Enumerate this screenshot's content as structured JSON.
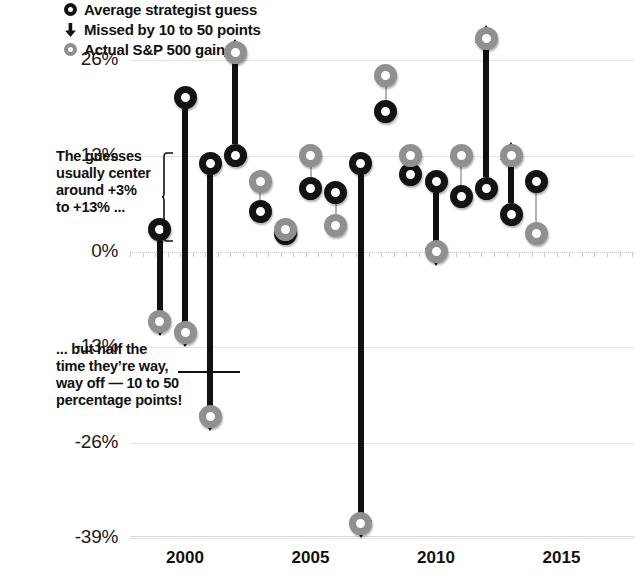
{
  "chart_data": {
    "type": "scatter",
    "title": "",
    "subtitle": "",
    "xlabel": "",
    "ylabel": "",
    "xtick_labels": [
      "2000",
      "2005",
      "2010",
      "2015"
    ],
    "xtick_values": [
      2000,
      2005,
      2010,
      2015
    ],
    "ytick_labels": [
      "26%",
      "13%",
      "0%",
      "-13%",
      "-26%",
      "-39%"
    ],
    "ytick_values": [
      26,
      13,
      0,
      -13,
      -26,
      -39
    ],
    "ylim": [
      -42,
      31
    ],
    "xlim": [
      1998.2,
      2016.6
    ],
    "grid": true,
    "legend_position": "top-left",
    "legend": [
      {
        "key": "guess",
        "label": "Average strategist guess",
        "marker": "ring-black",
        "color": "#131313"
      },
      {
        "key": "missed",
        "label": "Missed by 10 to 50 points",
        "marker": "down-arrow",
        "color": "#101010"
      },
      {
        "key": "actual",
        "label": "Actual S&P 500 gain",
        "marker": "ring-gray",
        "color": "#909090"
      }
    ],
    "series": [
      {
        "name": "Average strategist guess",
        "color": "#131313",
        "values": [
          3.0,
          21.0,
          12.0,
          13.0,
          5.5,
          2.5,
          8.5,
          8.0,
          12.0,
          19.0,
          10.5,
          9.5,
          7.5,
          8.5,
          5.0,
          9.5
        ]
      },
      {
        "name": "Actual S&P 500 gain",
        "color": "#909090",
        "values": [
          -9.5,
          -11.0,
          -22.5,
          27.0,
          9.5,
          3.0,
          13.0,
          3.5,
          -37.0,
          24.0,
          13.0,
          0.0,
          13.0,
          29.0,
          13.0,
          2.5
        ]
      }
    ],
    "x": [
      1999,
      2000,
      2001,
      2002,
      2003,
      2004,
      2005,
      2006,
      2007,
      2008,
      2009,
      2010,
      2011,
      2012,
      2013,
      2014
    ],
    "points": [
      {
        "x": 1999,
        "guess": 3.0,
        "actual": -9.5,
        "big_miss": true,
        "direction": "down"
      },
      {
        "x": 2000,
        "guess": 21.0,
        "actual": -11.0,
        "big_miss": true,
        "direction": "down"
      },
      {
        "x": 2001,
        "guess": 12.0,
        "actual": -22.5,
        "big_miss": true,
        "direction": "down"
      },
      {
        "x": 2002,
        "guess": 13.0,
        "actual": 27.0,
        "big_miss": true,
        "direction": "up"
      },
      {
        "x": 2003,
        "guess": 5.5,
        "actual": 9.5,
        "big_miss": false,
        "direction": "none"
      },
      {
        "x": 2004,
        "guess": 2.5,
        "actual": 3.0,
        "big_miss": false,
        "direction": "none"
      },
      {
        "x": 2005,
        "guess": 8.5,
        "actual": 13.0,
        "big_miss": false,
        "direction": "none"
      },
      {
        "x": 2006,
        "guess": 8.0,
        "actual": 3.5,
        "big_miss": false,
        "direction": "none"
      },
      {
        "x": 2007,
        "guess": 12.0,
        "actual": -37.0,
        "big_miss": true,
        "direction": "down"
      },
      {
        "x": 2008,
        "guess": 19.0,
        "actual": 24.0,
        "big_miss": false,
        "direction": "none"
      },
      {
        "x": 2009,
        "guess": 10.5,
        "actual": 13.0,
        "big_miss": false,
        "direction": "none"
      },
      {
        "x": 2010,
        "guess": 9.5,
        "actual": 0.0,
        "big_miss": true,
        "direction": "down"
      },
      {
        "x": 2011,
        "guess": 7.5,
        "actual": 13.0,
        "big_miss": false,
        "direction": "none"
      },
      {
        "x": 2012,
        "guess": 8.5,
        "actual": 29.0,
        "big_miss": true,
        "direction": "up"
      },
      {
        "x": 2013,
        "guess": 5.0,
        "actual": 13.0,
        "big_miss": true,
        "direction": "up"
      },
      {
        "x": 2014,
        "guess": 9.5,
        "actual": 2.5,
        "big_miss": false,
        "direction": "none"
      }
    ],
    "annotations": [
      {
        "key": "upper",
        "text": "The guesses usually center around +3% to +13% ..."
      },
      {
        "key": "lower",
        "text": "... but half the time they’re way, way off — 10 to 50 percentage points!"
      }
    ]
  },
  "annotation_upper_lines": [
    "The guesses",
    "usually center",
    "around +3%",
    "to +13% ..."
  ],
  "annotation_lower_lines": [
    "... but half the",
    "time they’re way,",
    "way off — 10 to 50",
    "percentage points!"
  ],
  "legend_labels": {
    "guess": "Average strategist guess",
    "missed": "Missed by 10 to 50 points",
    "actual": "Actual S&P 500 gain"
  },
  "icons": {
    "guess_marker": "black-ring-icon",
    "missed_marker": "down-arrow-icon",
    "actual_marker": "gray-ring-icon"
  }
}
